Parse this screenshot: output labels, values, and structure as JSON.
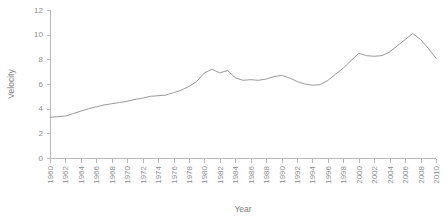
{
  "chart_data": {
    "type": "line",
    "title": "",
    "xlabel": "Year",
    "ylabel": "Velocity",
    "xlim": [
      1960,
      2010
    ],
    "ylim": [
      0,
      12
    ],
    "yticks": [
      0,
      2,
      4,
      6,
      8,
      10,
      12
    ],
    "xticks": [
      1960,
      1962,
      1964,
      1966,
      1968,
      1970,
      1972,
      1974,
      1976,
      1978,
      1980,
      1982,
      1984,
      1986,
      1988,
      1990,
      1992,
      1994,
      1996,
      1998,
      2000,
      2002,
      2004,
      2006,
      2008,
      2010
    ],
    "xtick_labels": [
      "1960",
      "1962",
      "1964",
      "1966",
      "1968",
      "1970",
      "1972",
      "1974",
      "1976",
      "1978",
      "1980",
      "1982",
      "1984",
      "1986",
      "1988",
      "1990",
      "1992",
      "1994",
      "1996",
      "1998",
      "2000",
      "2002",
      "2004",
      "2006",
      "2008",
      "2010"
    ],
    "ytick_labels": [
      "0",
      "2",
      "4",
      "6",
      "8",
      "10",
      "12"
    ],
    "xtick_label_rotation": -90,
    "grid": false,
    "legend": false,
    "legend_position": "none",
    "line_color": "#9a9a9a",
    "axis_color": "#b9b9b9",
    "text_color": "#8d8d8d",
    "background_color": "#ffffff",
    "x": [
      1960,
      1961,
      1962,
      1963,
      1964,
      1965,
      1966,
      1967,
      1968,
      1969,
      1970,
      1971,
      1972,
      1973,
      1974,
      1975,
      1976,
      1977,
      1978,
      1979,
      1980,
      1981,
      1982,
      1983,
      1984,
      1985,
      1986,
      1987,
      1988,
      1989,
      1990,
      1991,
      1992,
      1993,
      1994,
      1995,
      1996,
      1997,
      1998,
      1999,
      2000,
      2001,
      2002,
      2003,
      2004,
      2005,
      2006,
      2007,
      2008,
      2009,
      2010
    ],
    "values": [
      3.3,
      3.35,
      3.4,
      3.6,
      3.8,
      4.0,
      4.15,
      4.3,
      4.4,
      4.5,
      4.6,
      4.75,
      4.85,
      5.0,
      5.05,
      5.1,
      5.3,
      5.5,
      5.8,
      6.2,
      6.9,
      7.2,
      6.9,
      7.1,
      6.5,
      6.3,
      6.35,
      6.3,
      6.4,
      6.6,
      6.7,
      6.5,
      6.2,
      6.0,
      5.9,
      5.95,
      6.3,
      6.8,
      7.3,
      7.9,
      8.5,
      8.3,
      8.25,
      8.3,
      8.6,
      9.1,
      9.6,
      10.1,
      9.6,
      8.9,
      8.1
    ],
    "series": [
      {
        "name": "Velocity",
        "values": [
          3.3,
          3.35,
          3.4,
          3.6,
          3.8,
          4.0,
          4.15,
          4.3,
          4.4,
          4.5,
          4.6,
          4.75,
          4.85,
          5.0,
          5.05,
          5.1,
          5.3,
          5.5,
          5.8,
          6.2,
          6.9,
          7.2,
          6.9,
          7.1,
          6.5,
          6.3,
          6.35,
          6.3,
          6.4,
          6.6,
          6.7,
          6.5,
          6.2,
          6.0,
          5.9,
          5.95,
          6.3,
          6.8,
          7.3,
          7.9,
          8.5,
          8.3,
          8.25,
          8.3,
          8.6,
          9.1,
          9.6,
          10.1,
          9.6,
          8.9,
          8.1
        ]
      }
    ]
  },
  "layout": {
    "plot_left": 50,
    "plot_right": 436,
    "plot_top": 10,
    "plot_bottom": 158,
    "ylabel_x": 14,
    "ylabel_y": 84,
    "xlabel_x": 243,
    "xlabel_y": 212
  }
}
